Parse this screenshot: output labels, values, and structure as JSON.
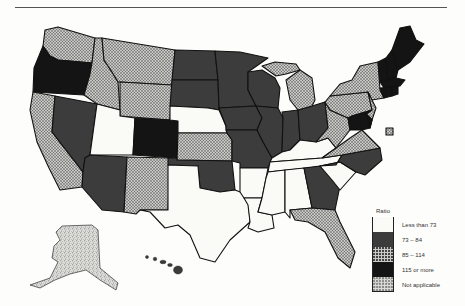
{
  "legend": {
    "title": "Ratio",
    "items": [
      {
        "label": "Less than 73",
        "class": "white",
        "fill": "#fafaf6"
      },
      {
        "label": "73 – 84",
        "class": "darkgray",
        "fill": "#3c3c3c"
      },
      {
        "label": "85 – 114",
        "class": "hatch",
        "fill": "url(#hatch)"
      },
      {
        "label": "115 or more",
        "class": "black",
        "fill": "#141414"
      },
      {
        "label": "Not applicable",
        "class": "stipple",
        "fill": "url(#stipple)"
      }
    ]
  },
  "states": {
    "WA": "hatch",
    "OR": "black",
    "CA": "hatch",
    "ID": "hatch",
    "NV": "darkgray",
    "MT": "hatch",
    "WY": "hatch",
    "UT": "white",
    "AZ": "darkgray",
    "CO": "black",
    "NM": "hatch",
    "ND": "darkgray",
    "SD": "darkgray",
    "NE": "white",
    "KS": "hatch",
    "OK": "darkgray",
    "TX": "white",
    "MN": "darkgray",
    "IA": "darkgray",
    "MO": "darkgray",
    "AR": "white",
    "LA": "white",
    "WI": "darkgray",
    "IL": "darkgray",
    "MI": "hatch",
    "IN": "darkgray",
    "OH": "darkgray",
    "KY": "white",
    "TN": "white",
    "MS": "white",
    "AL": "white",
    "GA": "darkgray",
    "FL": "hatch",
    "SC": "white",
    "NC": "darkgray",
    "VA": "hatch",
    "WV": "hatch",
    "PA": "hatch",
    "NY": "hatch",
    "NJ": "hatch",
    "MD": "black",
    "DE": "black",
    "DC": "hatch",
    "ME": "black",
    "NH": "black",
    "VT": "black",
    "MA": "black",
    "CT": "black",
    "RI": "black",
    "AK": "stipple",
    "HI": "darkgray"
  }
}
